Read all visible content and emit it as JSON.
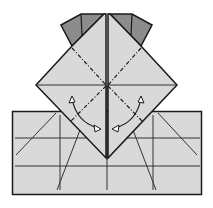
{
  "diagram": {
    "type": "origami-fold-step",
    "colors": {
      "background": "#ffffff",
      "paper_light": "#d9d9d9",
      "paper_dark": "#8c8c8c",
      "line": "#1a1a1a",
      "arrow_fill": "#ffffff"
    },
    "elements": [
      "top-left-dark-flap",
      "top-right-dark-flap",
      "center-diamond",
      "base-rectangle",
      "valley-fold-dash-lines",
      "curved-fold-arrow-left",
      "curved-fold-arrow-right"
    ]
  }
}
